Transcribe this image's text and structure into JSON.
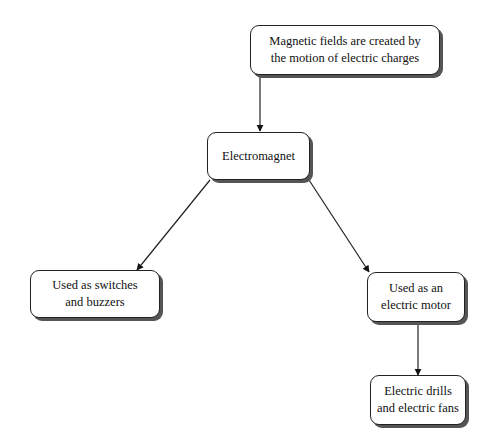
{
  "diagram": {
    "nodes": [
      {
        "id": "magnetic_fields",
        "label": "Magnetic fields are created by\nthe motion of electric charges"
      },
      {
        "id": "electromagnet",
        "label": "Electromagnet"
      },
      {
        "id": "switches",
        "label": "Used as switches\nand buzzers"
      },
      {
        "id": "motor",
        "label": "Used as an\nelectric motor"
      },
      {
        "id": "drills",
        "label": "Electric drills\nand electric fans"
      }
    ],
    "edges": [
      {
        "from": "magnetic_fields",
        "to": "electromagnet"
      },
      {
        "from": "electromagnet",
        "to": "switches"
      },
      {
        "from": "electromagnet",
        "to": "motor"
      },
      {
        "from": "motor",
        "to": "drills"
      }
    ]
  }
}
